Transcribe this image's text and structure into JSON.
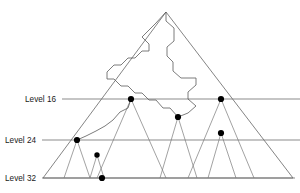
{
  "figure": {
    "title": "",
    "width": 300,
    "height": 193,
    "background_color": "#ffffff"
  },
  "labels": {
    "level_16": "Level 16",
    "level_24": "Level 24",
    "level_32": "Level 32"
  },
  "colors": {
    "level_rule": "#8c8c8c",
    "outer_triangle": "#6e6e6e",
    "subtree_edge": "#7a7a7a",
    "jagged_path": "#5a5a5a",
    "node_dot": "#000000",
    "label_text": "#1a1a1a"
  },
  "chart_data": {
    "type": "diagram",
    "title": "",
    "xlabel": "",
    "ylabel": "",
    "levels": [
      {
        "name": "Level 16",
        "y": 99,
        "x_start": 62,
        "x_end": 300,
        "label_x": 56
      },
      {
        "name": "Level 24",
        "y": 140,
        "x_start": 42,
        "x_end": 300,
        "label_x": 36
      },
      {
        "name": "Level 32",
        "y": 178,
        "x_start": 42,
        "x_end": 295,
        "label_x": 36
      }
    ],
    "outer_triangle": {
      "apex": [
        166,
        12
      ],
      "bottom_left": [
        43,
        178
      ],
      "bottom_right": [
        293,
        178
      ]
    },
    "nodes": [
      {
        "id": "n1",
        "x": 131,
        "y": 99,
        "level": "Level 16",
        "r": 3.1
      },
      {
        "id": "n2",
        "x": 221,
        "y": 99,
        "level": "Level 16",
        "r": 3.1
      },
      {
        "id": "n3",
        "x": 178,
        "y": 117,
        "level": "between 16 and 24",
        "r": 3.1
      },
      {
        "id": "n4",
        "x": 77,
        "y": 140,
        "level": "Level 24",
        "r": 3.1
      },
      {
        "id": "n5",
        "x": 221,
        "y": 133,
        "level": "between 16 and 24",
        "r": 3.1
      },
      {
        "id": "n6",
        "x": 97,
        "y": 155,
        "level": "between 24 and 32",
        "r": 2.7
      },
      {
        "id": "n7",
        "x": 102,
        "y": 178,
        "level": "Level 32",
        "r": 3.1
      }
    ],
    "subtrees": [
      {
        "apex": [
          131,
          99
        ],
        "bottom_left": [
          97,
          178
        ],
        "bottom_right": [
          166,
          178
        ]
      },
      {
        "apex": [
          221,
          99
        ],
        "bottom_left": [
          188,
          178
        ],
        "bottom_right": [
          254,
          178
        ]
      },
      {
        "apex": [
          178,
          117
        ],
        "bottom_left": [
          160,
          178
        ],
        "bottom_right": [
          197,
          178
        ]
      },
      {
        "apex": [
          77,
          140
        ],
        "bottom_left": [
          64,
          178
        ],
        "bottom_right": [
          90,
          178
        ]
      },
      {
        "apex": [
          221,
          133
        ],
        "bottom_left": [
          208,
          178
        ],
        "bottom_right": [
          236,
          178
        ]
      },
      {
        "apex": [
          97,
          155
        ],
        "bottom_left": [
          90,
          178
        ],
        "bottom_right": [
          104,
          178
        ]
      }
    ],
    "jagged_path": [
      [
        166,
        12
      ],
      [
        166,
        21
      ],
      [
        174,
        28
      ],
      [
        174,
        41
      ],
      [
        167,
        47
      ],
      [
        167,
        56
      ],
      [
        173,
        62
      ],
      [
        173,
        71
      ],
      [
        181,
        78
      ],
      [
        196,
        78
      ],
      [
        196,
        85
      ],
      [
        188,
        92
      ],
      [
        188,
        99
      ],
      [
        196,
        106
      ],
      [
        188,
        113
      ],
      [
        178,
        117
      ],
      [
        170,
        108
      ],
      [
        163,
        108
      ],
      [
        156,
        100
      ],
      [
        149,
        100
      ],
      [
        142,
        93
      ],
      [
        135,
        93
      ],
      [
        128,
        86
      ],
      [
        121,
        86
      ],
      [
        114,
        79
      ],
      [
        107,
        79
      ],
      [
        107,
        72
      ],
      [
        114,
        65
      ],
      [
        121,
        65
      ],
      [
        128,
        58
      ],
      [
        135,
        58
      ],
      [
        142,
        51
      ],
      [
        149,
        51
      ],
      [
        149,
        44
      ],
      [
        142,
        37
      ],
      [
        149,
        30
      ],
      [
        156,
        23
      ],
      [
        166,
        12
      ]
    ],
    "jagged_tail": [
      [
        131,
        99
      ],
      [
        128,
        108
      ],
      [
        120,
        112
      ],
      [
        113,
        120
      ],
      [
        105,
        126
      ],
      [
        96,
        131
      ],
      [
        86,
        136
      ],
      [
        77,
        140
      ]
    ]
  }
}
